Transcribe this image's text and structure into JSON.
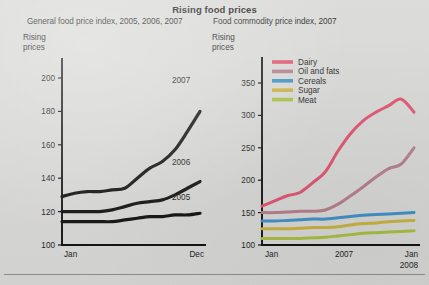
{
  "title": "Rising food prices",
  "left_panel": {
    "subtitle": "General food price index, 2005, 2006, 2007",
    "axis_caption_line1": "Rising",
    "axis_caption_line2": "prices",
    "y_ticks": [
      "200",
      "180",
      "160",
      "140",
      "120",
      "100"
    ],
    "x_ticks": [
      "Jan",
      "Dec"
    ],
    "series_labels": [
      "2007",
      "2006",
      "2005"
    ]
  },
  "right_panel": {
    "subtitle": "Food commodity price index, 2007",
    "axis_caption_line1": "Rising",
    "axis_caption_line2": "prices",
    "y_ticks": [
      "350",
      "300",
      "250",
      "200",
      "150",
      "100"
    ],
    "x_ticks": [
      "Jan",
      "2007",
      "Jan",
      "2008"
    ],
    "legend": [
      "Dairy",
      "Oil and fats",
      "Cereals",
      "Sugar",
      "Meat"
    ]
  },
  "colors": {
    "dairy": "#e0536f",
    "oil_and_fats": "#b57e8c",
    "cereals": "#3e90c8",
    "sugar": "#c9b33c",
    "meat": "#a8c040",
    "line_black": "#111111",
    "background": "#d8d8d6"
  },
  "chart_data": [
    {
      "type": "line",
      "title": "General food price index, 2005, 2006, 2007",
      "xlabel": "",
      "ylabel": "Rising prices",
      "ylim": [
        100,
        205
      ],
      "xlim": [
        0,
        11
      ],
      "grid": false,
      "legend_position": "inline-right",
      "x": [
        "Jan",
        "Feb",
        "Mar",
        "Apr",
        "May",
        "Jun",
        "Jul",
        "Aug",
        "Sep",
        "Oct",
        "Nov",
        "Dec"
      ],
      "series": [
        {
          "name": "2005",
          "color": "#111111",
          "values": [
            114,
            114,
            114,
            114,
            114,
            115,
            116,
            117,
            117,
            118,
            118,
            119
          ]
        },
        {
          "name": "2006",
          "color": "#111111",
          "values": [
            120,
            120,
            120,
            120,
            121,
            123,
            125,
            126,
            127,
            130,
            134,
            138
          ]
        },
        {
          "name": "2007",
          "color": "#111111",
          "values": [
            129,
            131,
            132,
            132,
            133,
            134,
            140,
            146,
            150,
            157,
            168,
            180
          ]
        }
      ]
    },
    {
      "type": "line",
      "title": "Food commodity price index, 2007",
      "xlabel": "",
      "ylabel": "Rising prices",
      "ylim": [
        100,
        360
      ],
      "xlim": [
        0,
        12
      ],
      "grid": false,
      "legend_position": "top-left",
      "x": [
        "Jan 2007",
        "Feb",
        "Mar",
        "Apr",
        "May",
        "Jun",
        "Jul",
        "Aug",
        "Sep",
        "Oct",
        "Nov",
        "Dec",
        "Jan 2008"
      ],
      "series": [
        {
          "name": "Dairy",
          "color": "#e0536f",
          "values": [
            160,
            168,
            176,
            181,
            196,
            213,
            245,
            272,
            292,
            305,
            315,
            325,
            305
          ]
        },
        {
          "name": "Oil and fats",
          "color": "#b57e8c",
          "values": [
            150,
            150,
            151,
            152,
            152,
            154,
            163,
            176,
            190,
            205,
            218,
            225,
            250
          ]
        },
        {
          "name": "Cereals",
          "color": "#3e90c8",
          "values": [
            137,
            137,
            138,
            139,
            140,
            140,
            142,
            144,
            146,
            147,
            148,
            149,
            150
          ]
        },
        {
          "name": "Sugar",
          "color": "#c9b33c",
          "values": [
            125,
            125,
            125,
            126,
            127,
            127,
            128,
            131,
            133,
            134,
            136,
            137,
            138
          ]
        },
        {
          "name": "Meat",
          "color": "#a8c040",
          "values": [
            110,
            110,
            110,
            110,
            111,
            112,
            114,
            116,
            118,
            119,
            120,
            121,
            122
          ]
        }
      ]
    }
  ]
}
